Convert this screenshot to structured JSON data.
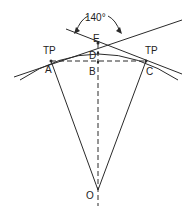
{
  "diagram": {
    "type": "curve-geometry",
    "angle_label": "140°",
    "labels": {
      "tp_left": "TP",
      "tp_right": "TP",
      "A": "A",
      "B": "B",
      "C": "C",
      "D": "D",
      "E": "E",
      "O": "O"
    },
    "points": {
      "A": [
        51,
        61
      ],
      "B": [
        98,
        62
      ],
      "C": [
        146,
        61
      ],
      "D": [
        98,
        53
      ],
      "E": [
        98,
        43
      ],
      "O": [
        98,
        190
      ]
    },
    "line_color": "#2a2a2a"
  }
}
